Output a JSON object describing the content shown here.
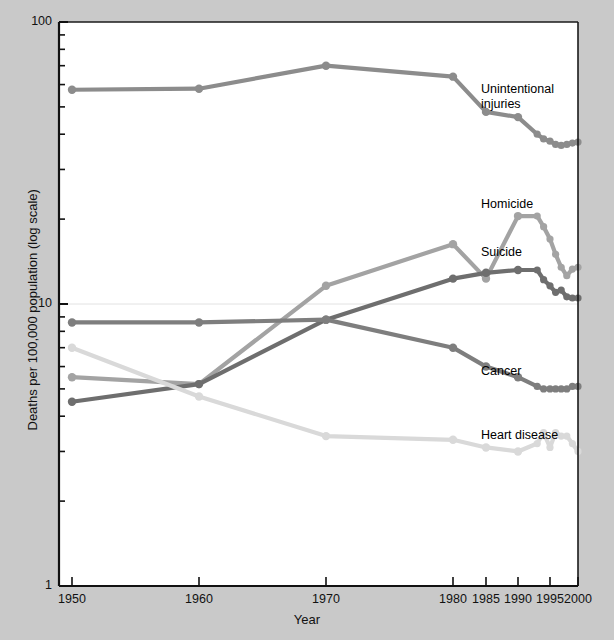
{
  "chart_data": {
    "type": "line",
    "title": "",
    "xlabel": "Year",
    "ylabel": "Deaths per 100,000 population (log scale)",
    "yscale": "log",
    "ylim": [
      1,
      100
    ],
    "ytick_labels": [
      "100",
      "10",
      "1"
    ],
    "ytick_values": [
      100,
      10,
      1
    ],
    "yminor_ticks": [
      90,
      80,
      70,
      60,
      50,
      40,
      30,
      20,
      9,
      8,
      7,
      6,
      5,
      4,
      3,
      2
    ],
    "grid": "horizontal-at-10",
    "legend": "inline-labels",
    "xtick_labels": [
      "1950",
      "1960",
      "1970",
      "1980",
      "1985",
      "1990",
      "1995",
      "2000"
    ],
    "xtick_values": [
      1950,
      1960,
      1970,
      1980,
      1985,
      1990,
      1995,
      2000
    ],
    "x_axis_note": "piecewise spacing: decades 1950-1980 then 5-year steps to 2000",
    "series": [
      {
        "name": "Unintentional injuries",
        "color": "#8c8c8c",
        "label_lines": [
          "Unintentional",
          "injuries"
        ],
        "x": [
          1950,
          1960,
          1970,
          1980,
          1985,
          1990,
          1993,
          1994,
          1995,
          1996,
          1997,
          1998,
          1999,
          2000
        ],
        "values": [
          57.5,
          58.0,
          70.0,
          64.0,
          48.0,
          46.0,
          40.0,
          38.5,
          37.8,
          36.8,
          36.5,
          36.8,
          37.2,
          37.5
        ]
      },
      {
        "name": "Homicide",
        "color": "#a3a3a3",
        "label_lines": [
          "Homicide"
        ],
        "x": [
          1950,
          1960,
          1970,
          1980,
          1985,
          1990,
          1993,
          1994,
          1995,
          1996,
          1997,
          1998,
          1999,
          2000
        ],
        "values": [
          5.5,
          5.2,
          11.6,
          16.3,
          12.3,
          20.5,
          20.5,
          18.8,
          17.0,
          15.0,
          13.5,
          12.6,
          13.3,
          13.5
        ]
      },
      {
        "name": "Suicide",
        "color": "#6e6e6e",
        "label_lines": [
          "Suicide"
        ],
        "x": [
          1950,
          1960,
          1970,
          1980,
          1985,
          1990,
          1993,
          1994,
          1995,
          1996,
          1997,
          1998,
          1999,
          2000
        ],
        "values": [
          4.5,
          5.2,
          8.8,
          12.3,
          12.9,
          13.2,
          13.2,
          12.2,
          11.6,
          11.0,
          11.2,
          10.6,
          10.5,
          10.5
        ]
      },
      {
        "name": "Cancer",
        "color": "#7e7e7e",
        "label_lines": [
          "Cancer"
        ],
        "x": [
          1950,
          1960,
          1970,
          1980,
          1985,
          1990,
          1993,
          1994,
          1995,
          1996,
          1997,
          1998,
          1999,
          2000
        ],
        "values": [
          8.6,
          8.6,
          8.8,
          7.0,
          6.0,
          5.5,
          5.1,
          5.0,
          5.0,
          5.0,
          5.0,
          5.0,
          5.1,
          5.1
        ]
      },
      {
        "name": "Heart disease",
        "color": "#d9d9d9",
        "label_lines": [
          "Heart disease"
        ],
        "x": [
          1950,
          1960,
          1970,
          1980,
          1985,
          1990,
          1993,
          1994,
          1995,
          1996,
          1997,
          1998,
          1999,
          2000
        ],
        "values": [
          7.0,
          4.7,
          3.4,
          3.3,
          3.1,
          3.0,
          3.2,
          3.5,
          3.1,
          3.5,
          3.4,
          3.4,
          3.2,
          3.0
        ]
      }
    ]
  }
}
